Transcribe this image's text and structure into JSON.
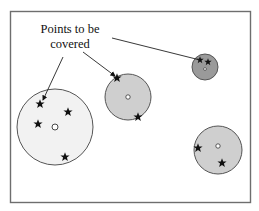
{
  "annotation": {
    "line1": "Points to be",
    "line2": "covered"
  },
  "colors": {
    "frame": "#6e6e6e",
    "circle_stroke": "#555555",
    "light_fill": "#f2f2f2",
    "mid_fill": "#cfcfcf",
    "dark_fill": "#9a9a9a",
    "star": "#111111"
  },
  "circles": [
    {
      "id": "large-left",
      "cx": 55,
      "cy": 127,
      "r": 38,
      "fill": "light"
    },
    {
      "id": "middle",
      "cx": 128,
      "cy": 97,
      "r": 23,
      "fill": "mid"
    },
    {
      "id": "small-top-right",
      "cx": 205,
      "cy": 67,
      "r": 13,
      "fill": "dark"
    },
    {
      "id": "bottom-right",
      "cx": 218,
      "cy": 150,
      "r": 24,
      "fill": "mid"
    }
  ],
  "stars": [
    {
      "x": 40,
      "y": 104
    },
    {
      "x": 68,
      "y": 112
    },
    {
      "x": 38,
      "y": 124
    },
    {
      "x": 65,
      "y": 157
    },
    {
      "x": 117,
      "y": 78
    },
    {
      "x": 138,
      "y": 117
    },
    {
      "x": 200,
      "y": 60
    },
    {
      "x": 208,
      "y": 62
    },
    {
      "x": 198,
      "y": 148
    },
    {
      "x": 222,
      "y": 163
    }
  ]
}
